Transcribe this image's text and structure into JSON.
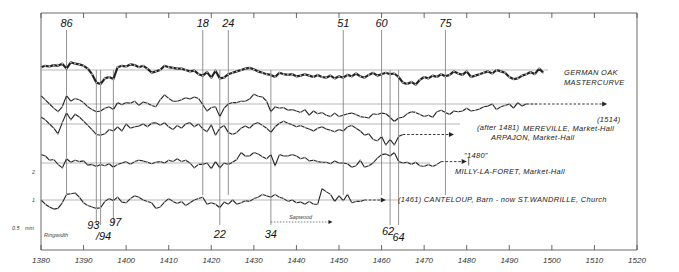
{
  "chart_data": {
    "type": "line",
    "title": "",
    "xlabel": "",
    "ylabel": "mm Ringwidth",
    "xlim": [
      1380,
      1520
    ],
    "x_ticks": [
      1380,
      1390,
      1400,
      1410,
      1420,
      1430,
      1440,
      1450,
      1460,
      1470,
      1480,
      1490,
      1500,
      1510,
      1520
    ],
    "y_axis_labels": [
      "2",
      "1",
      "0.5"
    ],
    "y_axis_unit": "mm",
    "y_axis_caption": "Ringwidth",
    "marker_years": [
      {
        "year": 1386,
        "label": "86",
        "position": "top"
      },
      {
        "year": 1393,
        "label": "93",
        "position": "bottom"
      },
      {
        "year": 1394,
        "label": "/94",
        "position": "bottom"
      },
      {
        "year": 1397,
        "label": "97",
        "position": "bottom"
      },
      {
        "year": 1418,
        "label": "18",
        "position": "top"
      },
      {
        "year": 1422,
        "label": "22",
        "position": "bottom"
      },
      {
        "year": 1424,
        "label": "24",
        "position": "top"
      },
      {
        "year": 1434,
        "label": "34",
        "position": "bottom"
      },
      {
        "year": 1451,
        "label": "51",
        "position": "top"
      },
      {
        "year": 1460,
        "label": "60",
        "position": "top"
      },
      {
        "year": 1462,
        "label": "62",
        "position": "bottom"
      },
      {
        "year": 1464,
        "label": "64",
        "position": "bottom"
      },
      {
        "year": 1475,
        "label": "75",
        "position": "top"
      }
    ],
    "series": [
      {
        "name": "GERMAN OAK MASTERCURVE",
        "label_lines": [
          "GERMAN OAK",
          "MASTERCURVE"
        ],
        "style": "bold",
        "start": 1380,
        "values": [
          0.2,
          0.3,
          0.25,
          0.35,
          0.3,
          0.45,
          0.1,
          0.55,
          0.45,
          0.4,
          0.3,
          0.1,
          -0.3,
          -0.9,
          -1.0,
          -0.6,
          -0.5,
          -0.65,
          0.2,
          0.3,
          0.25,
          0.4,
          0.35,
          0.2,
          0.3,
          0.1,
          -0.2,
          -0.1,
          0.0,
          0.3,
          0.2,
          0.15,
          0.1,
          0.1,
          0.0,
          -0.1,
          -0.05,
          -0.3,
          -0.4,
          -0.15,
          -0.55,
          -0.05,
          -0.6,
          -0.55,
          -0.3,
          -0.2,
          -0.1,
          0.0,
          0.1,
          0.15,
          0.05,
          -0.1,
          -0.2,
          -0.3,
          -0.35,
          -0.5,
          -0.2,
          -0.3,
          -0.35,
          -0.3,
          -0.45,
          -0.4,
          -0.3,
          -0.4,
          -0.5,
          -0.35,
          -0.5,
          -0.55,
          -0.4,
          -0.6,
          -0.45,
          -0.55,
          -0.35,
          -0.45,
          -0.25,
          -0.45,
          -0.55,
          -0.35,
          -0.2,
          -0.4,
          -0.3,
          -0.2,
          -0.3,
          -0.25,
          -0.5,
          -0.9,
          -1.0,
          -0.85,
          -1.05,
          -0.7,
          -0.5,
          -0.6,
          -0.4,
          -0.5,
          -0.3,
          -0.45,
          -0.35,
          -0.1,
          -0.25,
          -0.35,
          -0.1,
          -0.5,
          -0.4,
          -0.3,
          -0.2,
          -0.1,
          -0.25,
          0.0,
          -0.1,
          -0.2,
          -0.5,
          -0.65,
          -0.6,
          -0.4,
          -0.3,
          -0.15,
          -0.3,
          0.1,
          -0.2
        ]
      },
      {
        "name": "MEREVILLE, Market-Hall",
        "date_note": "(1514)",
        "start": 1380,
        "end_measured": 1494,
        "extends_to": 1513,
        "values": [
          0.6,
          0.3,
          0.0,
          -0.3,
          -0.55,
          -0.2,
          0.6,
          0.2,
          0.4,
          0.3,
          0.1,
          -0.2,
          -0.4,
          -0.55,
          -0.5,
          -0.3,
          -0.2,
          -0.4,
          0.1,
          -0.05,
          0.1,
          0.05,
          0.2,
          -0.1,
          0.15,
          0.05,
          -0.1,
          -0.2,
          0.3,
          0.65,
          0.4,
          0.2,
          0.2,
          0.3,
          0.45,
          0.35,
          0.5,
          0.4,
          -0.05,
          -0.5,
          -0.25,
          -0.2,
          -0.9,
          -0.3,
          0.0,
          0.1,
          0.1,
          0.2,
          0.2,
          0.35,
          0.7,
          0.55,
          0.5,
          0.2,
          -0.55,
          -0.2,
          -0.3,
          -0.25,
          -0.45,
          -0.4,
          -0.5,
          -0.6,
          -0.4,
          -0.8,
          -0.5,
          -0.7,
          -0.6,
          -0.8,
          -0.9,
          -0.65,
          -0.9,
          -0.8,
          -0.7,
          -0.65,
          -0.75,
          -0.9,
          -0.95,
          -1.0,
          -0.7,
          -0.75,
          -0.65,
          -0.7,
          -0.95,
          -1.25,
          -1.0,
          -0.95,
          -0.7,
          -0.55,
          -0.6,
          -0.75,
          -0.9,
          -0.8,
          -0.95,
          -0.55,
          -0.45,
          -0.6,
          -0.75,
          -0.5,
          -0.55,
          -0.5,
          -0.3,
          -0.5,
          -0.45,
          -0.35,
          -0.2,
          -0.15,
          0.0,
          -0.4,
          -0.2,
          -0.1,
          0.0,
          -0.3,
          0.1,
          -0.15,
          0.0
        ]
      },
      {
        "name": "ARPAJON, Market-Hall",
        "date_note": "(after 1481)",
        "start": 1380,
        "end_measured": 1465,
        "extends_to": 1477,
        "values": [
          0.5,
          0.3,
          0.0,
          -0.3,
          -0.7,
          0.1,
          0.8,
          0.3,
          0.7,
          0.5,
          0.2,
          -0.1,
          -0.4,
          -0.75,
          -0.8,
          -0.7,
          -0.4,
          -0.5,
          -0.2,
          -0.5,
          0.0,
          -0.3,
          -0.2,
          -0.15,
          0.0,
          -0.2,
          0.05,
          0.1,
          -0.1,
          0.1,
          -0.2,
          -0.4,
          -0.1,
          -0.3,
          0.0,
          0.1,
          -0.2,
          0.0,
          -0.35,
          -0.55,
          -0.05,
          -0.8,
          -0.3,
          -0.1,
          -0.6,
          -0.75,
          -0.6,
          -0.3,
          -0.15,
          -0.3,
          0.0,
          0.1,
          -0.1,
          -0.3,
          -0.6,
          -0.2,
          0.05,
          0.2,
          0.05,
          -0.05,
          -0.2,
          -0.1,
          -0.25,
          -0.35,
          -0.5,
          -0.3,
          -0.2,
          -0.35,
          -0.45,
          -0.55,
          -0.4,
          -0.5,
          -0.2,
          -0.1,
          -0.3,
          -0.5,
          -0.8,
          -0.7,
          -1.1,
          -1.2,
          -0.9,
          -1.5,
          -1.1,
          -1.5,
          -0.9,
          -0.75
        ]
      },
      {
        "name": "MILLY-LA-FORET, Market-Hall",
        "date_note": "\"1480\"",
        "start": 1380,
        "end_measured": 1472,
        "extends_to": 1480,
        "values": [
          0.6,
          0.5,
          0.2,
          0.25,
          -0.1,
          -0.35,
          0.3,
          0.05,
          0.2,
          0.1,
          0.15,
          -0.15,
          -0.1,
          -0.25,
          -0.1,
          -0.2,
          -0.05,
          -0.3,
          -0.1,
          0.0,
          0.1,
          -0.1,
          0.1,
          0.2,
          0.15,
          0.05,
          -0.05,
          0.05,
          0.1,
          0.0,
          0.2,
          0.1,
          0.3,
          0.1,
          0.2,
          0.0,
          -0.35,
          -0.1,
          -0.1,
          0.0,
          -0.4,
          0.1,
          -0.35,
          0.0,
          -0.1,
          0.05,
          0.25,
          0.75,
          0.5,
          0.5,
          0.75,
          0.65,
          0.45,
          0.3,
          0.6,
          -0.2,
          0.6,
          0.5,
          0.5,
          0.6,
          0.5,
          0.3,
          0.4,
          0.15,
          0.2,
          0.1,
          0.05,
          0.05,
          -0.05,
          0.15,
          0.0,
          0.0,
          -0.05,
          -0.3,
          -0.2,
          0.2,
          -0.3,
          -0.2,
          0.0,
          0.35,
          0.6,
          0.65,
          0.5,
          0.75,
          0.1,
          0.0,
          0.05,
          -0.1,
          0.05,
          -0.2,
          -0.25,
          -0.1,
          -0.25,
          -0.1,
          0.1
        ]
      },
      {
        "name": "CANTELOUP, Barn - now ST.WANDRILLE, Church",
        "date_note": "(1461)",
        "start": 1380,
        "end_measured": 1456,
        "extends_to": 1461,
        "values": [
          0.0,
          -0.3,
          -0.5,
          -0.65,
          -0.6,
          -0.2,
          0.4,
          0.45,
          0.5,
          0.2,
          -0.2,
          -0.4,
          -0.5,
          -0.6,
          -0.55,
          -0.1,
          0.1,
          -0.05,
          0.2,
          -0.15,
          -0.2,
          0.1,
          0.3,
          0.2,
          0.0,
          -0.1,
          -0.2,
          -0.6,
          -0.5,
          -0.15,
          0.1,
          -0.1,
          -0.25,
          -0.1,
          -0.4,
          -0.2,
          0.0,
          0.1,
          0.2,
          -0.3,
          -0.2,
          -0.3,
          -0.55,
          -0.15,
          -0.3,
          0.0,
          -0.3,
          -0.2,
          -0.05,
          -0.1,
          0.1,
          0.2,
          0.4,
          0.3,
          0.2,
          0.4,
          0.2,
          0.1,
          -0.1,
          0.0,
          -0.2,
          -0.15,
          -0.3,
          -0.1,
          -0.3,
          -0.3,
          0.8,
          0.6,
          0.4,
          -0.1,
          0.3,
          -0.05,
          0.4,
          -0.2,
          -0.1,
          -0.1,
          0.0
        ]
      }
    ],
    "annotations": [
      {
        "text": "Sapwood",
        "from_year": 1434,
        "to_year": 1448
      }
    ]
  }
}
